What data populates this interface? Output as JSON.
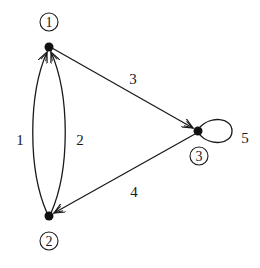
{
  "diagram": {
    "type": "directed-multigraph",
    "nodes": [
      {
        "id": "1",
        "label": "1",
        "x": 49,
        "y": 47,
        "label_x": 49,
        "label_y": 22
      },
      {
        "id": "2",
        "label": "2",
        "x": 49,
        "y": 216,
        "label_x": 49,
        "label_y": 241
      },
      {
        "id": "3",
        "label": "3",
        "x": 198,
        "y": 131,
        "label_x": 199,
        "label_y": 156
      }
    ],
    "edges": [
      {
        "id": "e1",
        "label": "1",
        "from": "2",
        "to": "1",
        "shape": "arc-left",
        "label_x": 20,
        "label_y": 145
      },
      {
        "id": "e2",
        "label": "2",
        "from": "2",
        "to": "1",
        "shape": "arc-right",
        "label_x": 80,
        "label_y": 145
      },
      {
        "id": "e3",
        "label": "3",
        "from": "1",
        "to": "3",
        "shape": "straight",
        "label_x": 133,
        "label_y": 84
      },
      {
        "id": "e4",
        "label": "4",
        "from": "3",
        "to": "2",
        "shape": "straight",
        "label_x": 134,
        "label_y": 197
      },
      {
        "id": "e5",
        "label": "5",
        "from": "3",
        "to": "3",
        "shape": "self-loop",
        "label_x": 245,
        "label_y": 143
      }
    ],
    "colors": {
      "stroke": "#1a1a1a",
      "background": "#ffffff"
    }
  }
}
